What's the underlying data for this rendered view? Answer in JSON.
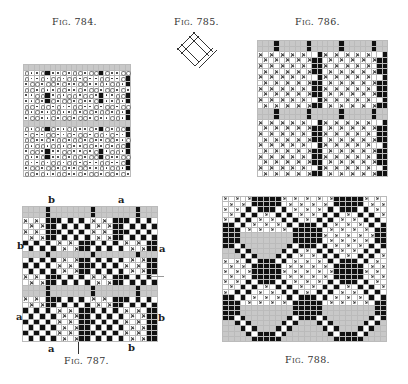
{
  "figures": [
    {
      "id": "fig784",
      "caption": "Fig. 784."
    },
    {
      "id": "fig785",
      "caption": "Fig. 785."
    },
    {
      "id": "fig786",
      "caption": "Fig. 786."
    },
    {
      "id": "fig787",
      "caption": "Fig. 787.",
      "labels": {
        "top_left": "b",
        "top_right": "a",
        "left_upper": "b",
        "right_upper": "a",
        "left_lower": "a",
        "right_lower": "b",
        "bottom_left": "a",
        "bottom_right": "b"
      }
    },
    {
      "id": "fig788",
      "caption": "Fig. 788."
    }
  ],
  "colors": {
    "ink": "#111111",
    "grid_line": "#bbbbbb",
    "shade": "#c8c8c8",
    "paper": "#ffffff"
  }
}
